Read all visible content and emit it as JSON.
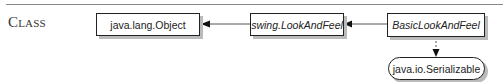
{
  "section_label": "Class",
  "nodes": {
    "object": {
      "label": "java.lang.Object",
      "kind": "class"
    },
    "lookandfeel": {
      "label": "swing.LookAndFeel",
      "kind": "abstract-class"
    },
    "basic": {
      "label": "BasicLookAndFeel",
      "kind": "abstract-class"
    },
    "serializable": {
      "label": "java.io.Serializable",
      "kind": "interface"
    }
  },
  "edges": [
    {
      "from": "basic",
      "to": "lookandfeel",
      "type": "extends"
    },
    {
      "from": "lookandfeel",
      "to": "object",
      "type": "extends"
    },
    {
      "from": "basic",
      "to": "serializable",
      "type": "implements"
    }
  ]
}
